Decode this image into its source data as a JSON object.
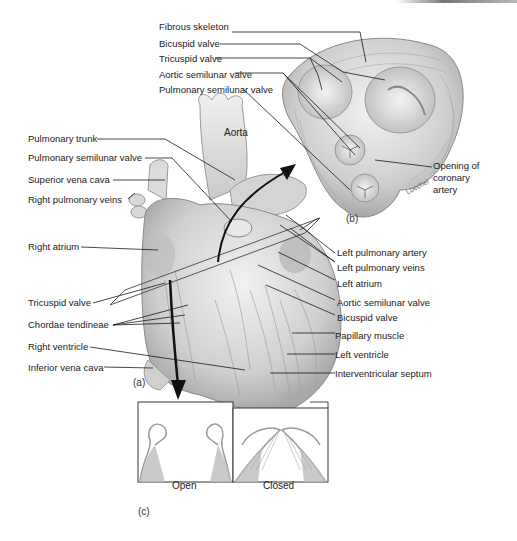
{
  "figure": {
    "panels": {
      "a": "(a)",
      "b": "(b)",
      "c": "(c)"
    },
    "signature": "Loechel",
    "colors": {
      "tissue": "#d6d6d6",
      "tissue_dark": "#9a9a9a",
      "line": "#1a1a1a",
      "arrow": "#111111",
      "background": "#ffffff"
    }
  },
  "panel_b_labels": {
    "fibrous_skeleton": "Fibrous skeleton",
    "bicuspid_valve": "Bicuspid valve",
    "tricuspid_valve": "Tricuspid valve",
    "aortic_semilunar_valve": "Aortic semilunar valve",
    "pulmonary_semilunar_valve": "Pulmonary semilunar valve",
    "opening_coronary_1": "Opening of",
    "opening_coronary_2": "coronary",
    "opening_coronary_3": "artery"
  },
  "panel_a_left_labels": {
    "aorta": "Aorta",
    "pulmonary_trunk": "Pulmonary trunk",
    "pulmonary_semilunar_valve": "Pulmonary semilunar valve",
    "superior_vena_cava": "Superior vena cava",
    "right_pulmonary_veins": "Right pulmonary veins",
    "right_atrium": "Right atrium",
    "tricuspid_valve": "Tricuspid valve",
    "chordae_tendineae": "Chordae tendineae",
    "right_ventricle": "Right ventricle",
    "inferior_vena_cava": "Inferior vena cava"
  },
  "panel_a_right_labels": {
    "left_pulmonary_artery": "Left pulmonary artery",
    "left_pulmonary_veins": "Left pulmonary veins",
    "left_atrium": "Left atrium",
    "aortic_semilunar_valve": "Aortic semilunar valve",
    "bicuspid_valve": "Bicuspid valve",
    "papillary_muscle": "Papillary muscle",
    "left_ventricle": "Left ventricle",
    "interventricular_septum": "Interventricular septum"
  },
  "panel_c_labels": {
    "open": "Open",
    "closed": "Closed"
  }
}
